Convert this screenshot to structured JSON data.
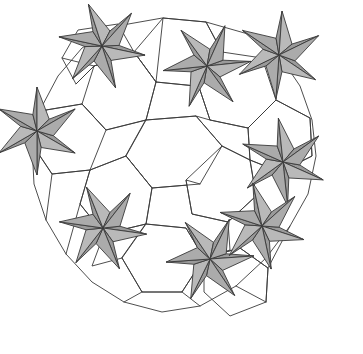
{
  "figure": {
    "type": "geometric-tiling-diagram",
    "width": 363,
    "height": 354,
    "background_color": "#ffffff",
    "stroke_color": "#3a3a3a",
    "stroke_width": 0.9,
    "shaded_fill": "#aaaaaa",
    "open_fill": "#ffffff"
  },
  "palette": {
    "gray_light": "#b9b9b9",
    "gray_mid": "#ababab",
    "gray_dark": "#9a9a9a",
    "line": "#3a3a3a",
    "white": "#ffffff"
  },
  "geometry": {
    "star_outer_radius": 44,
    "star_inner_radius": 17,
    "star_points": 6,
    "pinwheel_twist_deg": 16,
    "stars": [
      {
        "id": "star-top-left",
        "cx": 102,
        "cy": 46,
        "rot": 12,
        "complete": true
      },
      {
        "id": "star-top-center",
        "cx": 207,
        "cy": 66,
        "rot": -6,
        "complete": true
      },
      {
        "id": "star-left",
        "cx": 37,
        "cy": 131,
        "rot": 30,
        "complete": true
      },
      {
        "id": "star-right",
        "cx": 283,
        "cy": 162,
        "rot": 24,
        "complete": true
      },
      {
        "id": "star-bottom-left",
        "cx": 103,
        "cy": 228,
        "rot": 8,
        "complete": true
      },
      {
        "id": "star-bottom-center",
        "cx": 210,
        "cy": 259,
        "rot": -4,
        "complete": true
      },
      {
        "id": "star-bottom-right",
        "cx": 262,
        "cy": 226,
        "rot": 18,
        "complete": true
      },
      {
        "id": "star-upper-right",
        "cx": 279,
        "cy": 55,
        "rot": 34,
        "complete": false
      }
    ],
    "open_cells": [
      {
        "id": "cell-center-hex",
        "shape": "hexagon",
        "cx": 160,
        "cy": 140,
        "r": 48
      },
      {
        "id": "cell-center-right",
        "shape": "hexagon",
        "cx": 238,
        "cy": 140,
        "r": 40
      },
      {
        "id": "cell-mid-low",
        "shape": "hexagon",
        "cx": 160,
        "cy": 236,
        "r": 44
      },
      {
        "id": "cell-top-gap",
        "shape": "pentagon",
        "cx": 160,
        "cy": 36,
        "r": 40
      }
    ]
  },
  "chart_data": {
    "type": "table",
    "xlabel": "",
    "ylabel": "",
    "categories": [
      "shaded star tiles",
      "open white tiles"
    ],
    "values": [
      8,
      24
    ],
    "annotations": [
      "Six-pointed gray pinwheel stars at tiling vertices",
      "Each star point is a kite split by a chord into two triangles",
      "Stars connected by white hexagonal, pentagonal and triangular cells",
      "Outer boundary is an irregular near-circular polygon"
    ]
  }
}
